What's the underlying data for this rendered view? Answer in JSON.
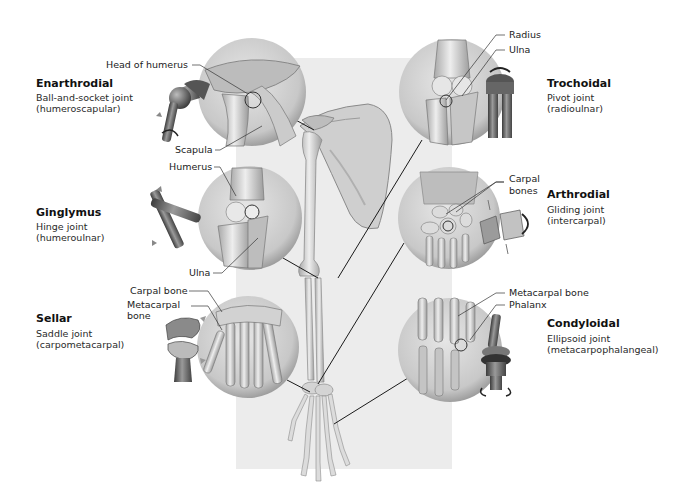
{
  "diagram": {
    "joints": [
      {
        "id": "enarthrodial",
        "title": "Enarthrodial",
        "type": "Ball-and-socket joint",
        "example": "(humeroscapular)",
        "callouts": [
          "Head of humerus",
          "Scapula"
        ],
        "side": "left",
        "row": 1
      },
      {
        "id": "ginglymus",
        "title": "Ginglymus",
        "type": "Hinge joint",
        "example": "(humeroulnar)",
        "callouts": [
          "Humerus",
          "Ulna"
        ],
        "side": "left",
        "row": 2
      },
      {
        "id": "sellar",
        "title": "Sellar",
        "type": "Saddle joint",
        "example": "(carpometacarpal)",
        "callouts": [
          "Carpal bone",
          "Metacarpal",
          "bone"
        ],
        "side": "left",
        "row": 3
      },
      {
        "id": "trochoidal",
        "title": "Trochoidal",
        "type": "Pivot joint",
        "example": "(radioulnar)",
        "callouts": [
          "Radius",
          "Ulna"
        ],
        "side": "right",
        "row": 1
      },
      {
        "id": "arthrodial",
        "title": "Arthrodial",
        "type": "Gliding joint",
        "example": "(intercarpal)",
        "callouts": [
          "Carpal",
          "bones"
        ],
        "side": "right",
        "row": 2
      },
      {
        "id": "condyloidal",
        "title": "Condyloidal",
        "type": "Ellipsoid joint",
        "example": "(metacarpophalangeal)",
        "callouts": [
          "Metacarpal bone",
          "Phalanx"
        ],
        "side": "right",
        "row": 3
      }
    ],
    "center_figure": "Skeleton of right upper limb: scapula, humerus, radius, ulna, carpals, metacarpals, phalanges",
    "colors": {
      "background": "#ffffff",
      "panel": "#ececec",
      "bone": "#d9d9d9",
      "bone_shadow": "#9a9a9a",
      "circle_fill": "#cfcfcf",
      "leader_line": "#1a1a1a",
      "model_dark": "#555555"
    }
  }
}
